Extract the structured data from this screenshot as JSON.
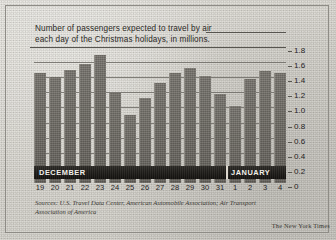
{
  "chart_data": {
    "type": "bar",
    "title": "Number of passengers expected to travel by air each day of the Christmas holidays, in millions.",
    "title_lines": [
      "Number of passengers expected to travel by air",
      "each day of the Christmas holidays, in millions."
    ],
    "xlabel": "",
    "ylabel": "",
    "ylim": [
      0,
      1.8
    ],
    "grid": true,
    "legend": "none",
    "categories": [
      "19",
      "20",
      "21",
      "22",
      "23",
      "24",
      "25",
      "26",
      "27",
      "28",
      "29",
      "30",
      "31",
      "1",
      "2",
      "3",
      "4"
    ],
    "ytick_labels": [
      "0",
      "0.2",
      "0.4",
      "0.6",
      "0.8",
      "1.0",
      "1.2",
      "1.4",
      "1.6",
      "1.8"
    ],
    "ytick_values": [
      0,
      0.2,
      0.4,
      0.6,
      0.8,
      1.0,
      1.2,
      1.4,
      1.6,
      1.8
    ],
    "values": [
      1.45,
      1.4,
      1.5,
      1.58,
      1.7,
      1.19,
      0.9,
      1.12,
      1.32,
      1.45,
      1.52,
      1.42,
      1.18,
      1.02,
      1.38,
      1.48,
      1.45
    ],
    "series": [
      {
        "name": "Passengers (millions)",
        "values": [
          1.45,
          1.4,
          1.5,
          1.58,
          1.7,
          1.19,
          0.9,
          1.12,
          1.32,
          1.45,
          1.52,
          1.42,
          1.18,
          1.02,
          1.38,
          1.48,
          1.45
        ]
      }
    ],
    "month_bands": [
      {
        "label": "DECEMBER",
        "start_index": 0,
        "end_index": 12
      },
      {
        "label": "JANUARY",
        "start_index": 13,
        "end_index": 16
      }
    ],
    "sources_lines": [
      "Sources: U.S. Travel Data Center, American Automobile Association; Air Transport",
      "Association of America"
    ],
    "sources": "Sources: U.S. Travel Data Center, American Automobile Association; Air Transport Association of America",
    "credit": "The New York Times",
    "colors": {
      "bar": "#6b6862",
      "grid": "#6e6c66",
      "band": "#1b1915",
      "band_text": "#f2f0ea",
      "text": "#26241f",
      "paper": "#d8d6d0"
    }
  }
}
